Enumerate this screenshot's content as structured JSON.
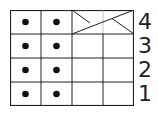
{
  "chart": {
    "type": "knitting-stitch-chart",
    "columns": 4,
    "rows": 4,
    "row_labels": [
      "4",
      "3",
      "2",
      "1"
    ],
    "cells": [
      [
        "purl-dot",
        "purl-dot",
        "cable-cross",
        "cable-cross"
      ],
      [
        "purl-dot",
        "purl-dot",
        "knit-blank",
        "knit-blank"
      ],
      [
        "purl-dot",
        "purl-dot",
        "knit-blank",
        "knit-blank"
      ],
      [
        "purl-dot",
        "purl-dot",
        "knit-blank",
        "knit-blank"
      ]
    ],
    "line_color": "#222222",
    "dot_color": "#111111"
  }
}
